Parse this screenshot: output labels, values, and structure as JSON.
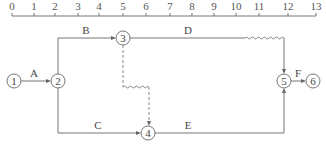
{
  "timescale": {
    "ticks": [
      "0",
      "1",
      "2",
      "3",
      "4",
      "5",
      "6",
      "7",
      "8",
      "9",
      "10",
      "11",
      "12",
      "13"
    ],
    "tick_x": [
      12,
      34,
      55,
      78,
      99,
      123,
      146,
      170,
      192,
      214,
      236,
      259,
      288,
      316
    ]
  },
  "nodes": [
    {
      "id": "1",
      "label": "1",
      "x": 14,
      "y": 81
    },
    {
      "id": "2",
      "label": "2",
      "x": 58,
      "y": 81
    },
    {
      "id": "3",
      "label": "3",
      "x": 123,
      "y": 38
    },
    {
      "id": "4",
      "label": "4",
      "x": 148,
      "y": 133
    },
    {
      "id": "5",
      "label": "5",
      "x": 284,
      "y": 81
    },
    {
      "id": "6",
      "label": "6",
      "x": 313,
      "y": 81
    }
  ],
  "activities": [
    {
      "id": "A",
      "label": "A",
      "from": "1",
      "to": "2",
      "type": "solid"
    },
    {
      "id": "B",
      "label": "B",
      "from": "2",
      "to": "3",
      "type": "solid"
    },
    {
      "id": "C",
      "label": "C",
      "from": "2",
      "to": "4",
      "type": "solid"
    },
    {
      "id": "D",
      "label": "D",
      "from": "3",
      "to": "5",
      "type": "solid-with-free-float"
    },
    {
      "id": "E",
      "label": "E",
      "from": "4",
      "to": "5",
      "type": "solid"
    },
    {
      "id": "F",
      "label": "F",
      "from": "5",
      "to": "6",
      "type": "solid"
    },
    {
      "id": "dummy",
      "label": "",
      "from": "3",
      "to": "4",
      "type": "dummy-with-free-float"
    }
  ],
  "labels": {
    "A": "A",
    "B": "B",
    "C": "C",
    "D": "D",
    "E": "E",
    "F": "F"
  }
}
